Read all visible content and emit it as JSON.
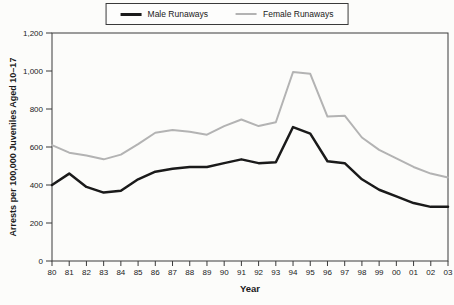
{
  "chart_data": {
    "type": "line",
    "title": "",
    "xlabel": "Year",
    "ylabel": "Arrests per 100,000 Juveniles Aged 10–17",
    "ylim": [
      0,
      1200
    ],
    "grid": "off",
    "legend_position": "top-center",
    "frame": "full-box",
    "y_ticks": [
      "0",
      "200",
      "400",
      "600",
      "800",
      "1,000",
      "1,200"
    ],
    "y_tick_values": [
      0,
      200,
      400,
      600,
      800,
      1000,
      1200
    ],
    "x_categories": [
      "80",
      "81",
      "82",
      "83",
      "84",
      "85",
      "86",
      "87",
      "88",
      "89",
      "90",
      "91",
      "92",
      "93",
      "94",
      "95",
      "96",
      "97",
      "98",
      "99",
      "00",
      "01",
      "02",
      "03"
    ],
    "series": [
      {
        "name": "Male Runaways",
        "color": "#1a1a1a",
        "stroke_width": 2.5,
        "values": [
          400,
          460,
          390,
          360,
          370,
          430,
          470,
          485,
          495,
          495,
          515,
          535,
          515,
          520,
          705,
          670,
          525,
          515,
          430,
          375,
          340,
          305,
          285,
          285
        ]
      },
      {
        "name": "Female Runaways",
        "color": "#b3b3b3",
        "stroke_width": 2,
        "values": [
          610,
          570,
          555,
          535,
          560,
          615,
          675,
          690,
          680,
          665,
          710,
          745,
          710,
          730,
          995,
          985,
          760,
          765,
          650,
          585,
          540,
          495,
          460,
          440
        ]
      }
    ],
    "axis_color": "#3a3a3a",
    "text_color": "#1a1a1a",
    "background_color": "#fcfcfa"
  }
}
